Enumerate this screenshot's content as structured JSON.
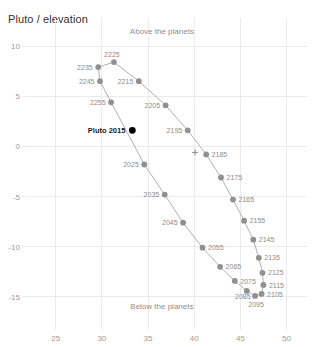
{
  "chart_data": {
    "type": "scatter",
    "title": "Pluto / elevation",
    "xlabel": "",
    "ylabel": "",
    "xlim": [
      22.0,
      52.0
    ],
    "ylim": [
      -17.5,
      11.8
    ],
    "xticks": [
      25,
      30,
      35,
      40,
      45,
      50
    ],
    "yticks": [
      10,
      5,
      0,
      -5,
      -10,
      -15
    ],
    "grid": true,
    "legend": "none",
    "annotations": [
      {
        "text": "Above the planets",
        "x": 36.5,
        "y": 11.2
      },
      {
        "text": "Below the planets",
        "x": 36.5,
        "y": -16.2
      },
      {
        "text": "Pluto 2015",
        "x": 31.0,
        "y": 1.6
      }
    ],
    "origin_marker": {
      "symbol": "+",
      "x": 40.1,
      "y": -0.6
    },
    "series": [
      {
        "name": "Pluto orbit elevation by decade",
        "point_labels": [
          "2025",
          "2035",
          "2045",
          "2055",
          "2065",
          "2075",
          "2085",
          "2095",
          "2105",
          "2115",
          "2125",
          "2135",
          "2145",
          "2155",
          "2165",
          "2175",
          "2185",
          "2195",
          "2205",
          "2215",
          "2225",
          "2235",
          "2245",
          "2255"
        ],
        "x": [
          34.6,
          36.8,
          38.8,
          40.9,
          42.8,
          44.4,
          45.7,
          46.6,
          47.3,
          47.5,
          47.4,
          47.0,
          46.4,
          45.4,
          44.2,
          42.9,
          41.3,
          39.3,
          36.9,
          34.0,
          31.3,
          29.6,
          29.8,
          31.0
        ],
        "y": [
          -1.8,
          -4.8,
          -7.6,
          -10.1,
          -12.0,
          -13.4,
          -14.4,
          -14.9,
          -14.7,
          -13.8,
          -12.6,
          -11.1,
          -9.3,
          -7.4,
          -5.3,
          -3.1,
          -0.8,
          1.6,
          4.1,
          6.5,
          8.4,
          7.9,
          6.5,
          4.4
        ]
      }
    ],
    "highlight_point": {
      "label": "Pluto 2015",
      "x": 33.3,
      "y": 1.6,
      "color": "#000000"
    }
  },
  "style": {
    "marker_color": "#909090",
    "line_color": "#b0b0b0",
    "grid_color": "#ebebeb",
    "tick_color": "#9b9b9b",
    "title_color": "#333333",
    "background": "#ffffff"
  }
}
